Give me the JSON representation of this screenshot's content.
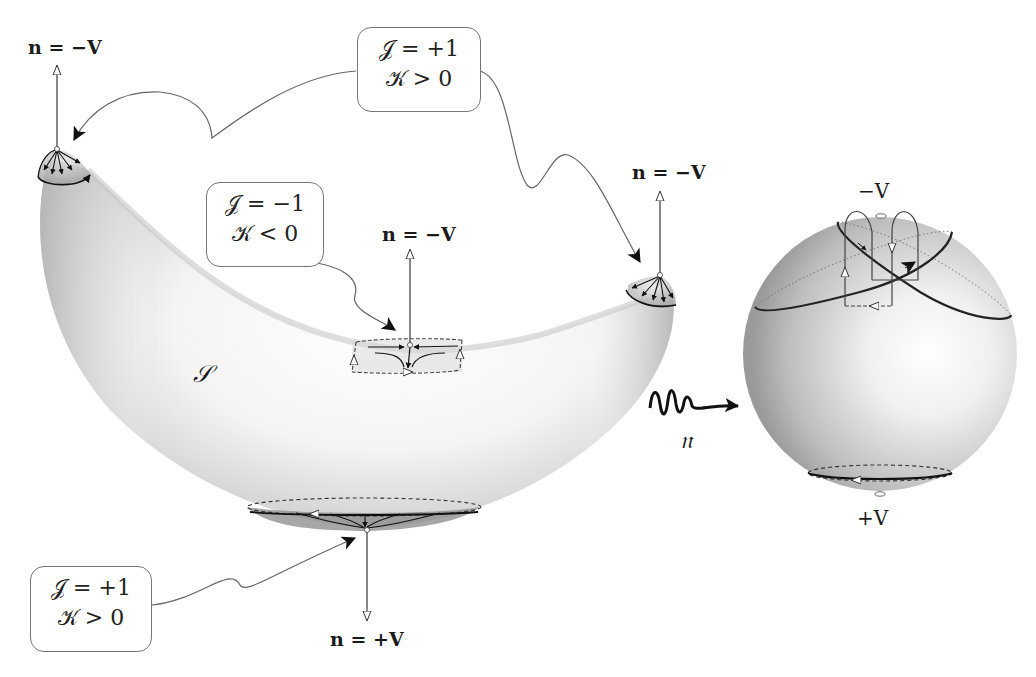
{
  "figure": {
    "surface_label": "𝒮",
    "map_label": "𝔫",
    "normal_labels": {
      "left_tip": "n = −V",
      "saddle": "n = −V",
      "right_tip": "n = −V",
      "bottom": "n = +V"
    },
    "sphere_labels": {
      "north": "−V",
      "south": "+V"
    },
    "callouts": [
      {
        "id": "top",
        "line1": "𝒥 = +1",
        "line2": "𝒦 > 0",
        "targets": [
          "left_tip",
          "right_tip"
        ]
      },
      {
        "id": "middle",
        "line1": "𝒥 = −1",
        "line2": "𝒦 < 0",
        "targets": [
          "saddle"
        ]
      },
      {
        "id": "bottom",
        "line1": "𝒥 = +1",
        "line2": "𝒦 > 0",
        "targets": [
          "bottom"
        ]
      }
    ],
    "colors": {
      "stroke": "#222222",
      "connector": "#666666",
      "shade_dark": "#8a8a8a",
      "shade_light": "#ffffff"
    }
  }
}
